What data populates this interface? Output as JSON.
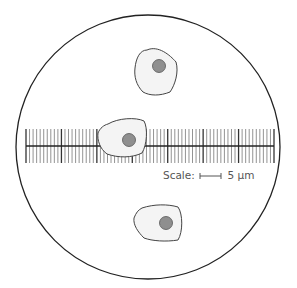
{
  "diagram": {
    "field_of_view": {
      "cx": 148,
      "cy": 147,
      "r": 132,
      "stroke": "#222222"
    },
    "ruler": {
      "x_start": 26,
      "x_end": 274,
      "y_center": 146,
      "half_height": 17,
      "minor_divisions": 70,
      "divisions_per_major": 10,
      "major_color": "#333333",
      "minor_color": "#777777"
    },
    "scale": {
      "label": "Scale:",
      "value": "5 µm",
      "bar_x1": 200,
      "bar_x2": 221,
      "bar_y": 176
    },
    "cells": [
      {
        "name": "cell-top",
        "path": "M 147 50 C 158 45, 170 55, 176 62 C 179 72, 175 85, 170 92 C 160 96, 150 96, 143 92 C 136 85, 134 76, 135 68 C 136 58, 140 50, 147 50 Z",
        "nucleus": {
          "cx": 159,
          "cy": 66,
          "r": 6.5
        }
      },
      {
        "name": "cell-middle",
        "path": "M 108 124 C 118 118, 136 117, 144 121 C 148 128, 147 145, 142 153 C 132 158, 118 158, 107 154 C 100 149, 97 140, 98 133 C 100 128, 104 125, 108 124 Z",
        "nucleus": {
          "cx": 129,
          "cy": 140,
          "r": 6.5
        }
      },
      {
        "name": "cell-bottom",
        "path": "M 142 208 C 154 204, 168 204, 178 207 C 183 214, 183 232, 178 240 C 166 242, 152 241, 144 238 C 138 232, 133 225, 134 218 C 136 213, 138 210, 142 208 Z",
        "nucleus": {
          "cx": 166,
          "cy": 223,
          "r": 6.5
        }
      }
    ],
    "colors": {
      "cell_fill": "#f4f4f4",
      "cell_stroke": "#444444",
      "nucleus_fill": "#8f8f8f",
      "nucleus_stroke": "#555555",
      "background": "#ffffff"
    }
  }
}
